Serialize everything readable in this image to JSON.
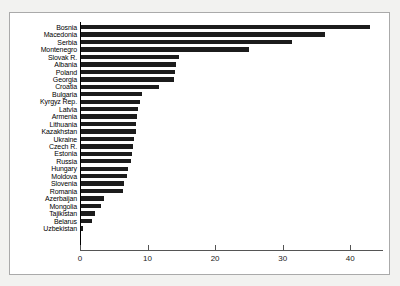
{
  "chart_data": {
    "type": "bar",
    "orientation": "horizontal",
    "title": "",
    "subtitle": "",
    "xlabel": "",
    "ylabel": "",
    "xlim": [
      0,
      44.9
    ],
    "grid": false,
    "legend": null,
    "xticks": [
      0,
      10,
      20,
      30,
      40
    ],
    "xtick_labels": [
      "0",
      "10",
      "20",
      "30",
      "40"
    ],
    "categories": [
      "Bosnia",
      "Macedonia",
      "Serbia",
      "Montenegro",
      "Slovak R.",
      "Albania",
      "Poland",
      "Georgia",
      "Croatia",
      "Bulgaria",
      "Kyrgyz Rep.",
      "Latvia",
      "Armenia",
      "Lithuania",
      "Kazakhstan",
      "Ukraine",
      "Czech R.",
      "Estonia",
      "Russia",
      "Hungary",
      "Moldova",
      "Slovenia",
      "Romania",
      "Azerbaijan",
      "Mongolia",
      "Tajikistan",
      "Belarus",
      "Uzbekistan"
    ],
    "values": [
      42.8,
      36.1,
      31.3,
      24.9,
      14.5,
      14.1,
      13.9,
      13.8,
      11.6,
      9.0,
      8.7,
      8.5,
      8.3,
      8.2,
      8.1,
      7.9,
      7.7,
      7.6,
      7.4,
      7.0,
      6.8,
      6.3,
      6.2,
      3.4,
      3.0,
      2.1,
      1.6,
      0.3
    ],
    "bar_color": "#1c1c1c",
    "plot_background": "#ffffff",
    "figure_background": "#f2f2f0"
  }
}
